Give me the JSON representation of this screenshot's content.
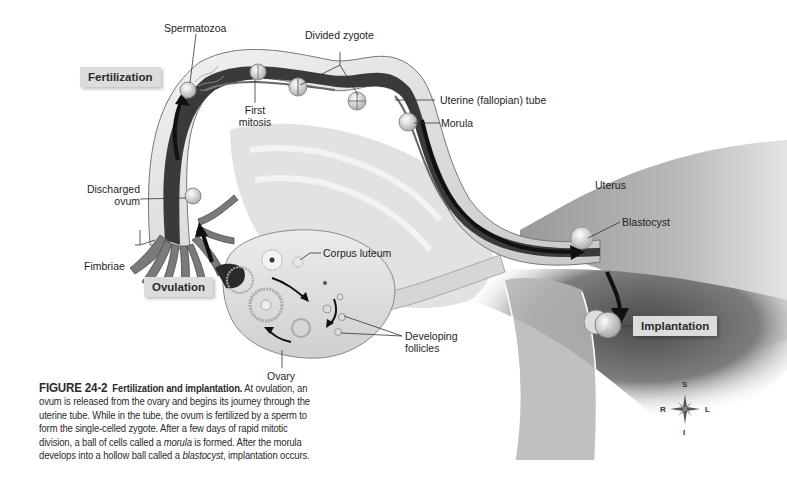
{
  "figure": {
    "number": "FIGURE 24-2",
    "title": "Fertilization and implantation.",
    "caption_parts": [
      " At ovulation, an ovum is released from the ovary and begins its journey through the uterine tube. While in the tube, the ovum is fertilized by a sperm to form the single-celled zygote. After a few days of rapid mitotic division, a ball of cells called a ",
      "morula",
      " is formed. After the morula develops into a hollow ball called a ",
      "blastocyst",
      ", implantation occurs."
    ]
  },
  "stage_tags": {
    "fertilization": "Fertilization",
    "ovulation": "Ovulation",
    "implantation": "Implantation"
  },
  "labels": {
    "spermatozoa": "Spermatozoa",
    "divided_zygote": "Divided zygote",
    "first_mitosis_line1": "First",
    "first_mitosis_line2": "mitosis",
    "uterine_tube": "Uterine (fallopian) tube",
    "morula": "Morula",
    "uterus": "Uterus",
    "blastocyst": "Blastocyst",
    "discharged_ovum_line1": "Discharged",
    "discharged_ovum_line2": "ovum",
    "fimbriae": "Fimbriae",
    "corpus_luteum": "Corpus luteum",
    "developing_follicles_line1": "Developing",
    "developing_follicles_line2": "follicles",
    "ovary": "Ovary"
  },
  "compass": {
    "superior": "S",
    "inferior": "I",
    "right": "R",
    "left": "L"
  },
  "colors": {
    "tissue_light": "#d8d8d8",
    "tissue_mid": "#a8a8a8",
    "tissue_dark": "#3a3a3a",
    "tag_bg": "#dcdcdc",
    "arrow": "#111111"
  }
}
